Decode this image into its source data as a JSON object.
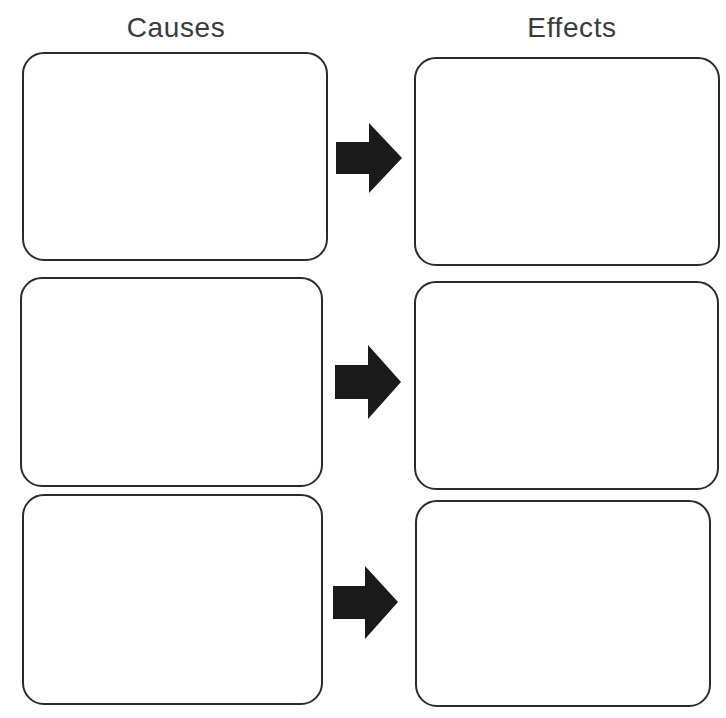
{
  "page": {
    "width": 726,
    "height": 718,
    "background_color": "#ffffff",
    "ink_color": "#2b2b2b",
    "text_color": "#3b3b3b",
    "arrow_color": "#1a1a1a",
    "title_fragment": "Cause and Effect",
    "document_kind": "cause-and-effect graphic organizer worksheet"
  },
  "headings": {
    "causes": "Causes",
    "effects": "Effects"
  },
  "rows": [
    {
      "index": 1,
      "cause_box": {
        "label": "",
        "x": 22,
        "y": 52,
        "w": 306,
        "h": 209
      },
      "arrow": {
        "name": "arrow-right-icon",
        "x": 336,
        "y": 123,
        "w": 66,
        "h": 70
      },
      "effect_box": {
        "label": "",
        "x": 414,
        "y": 57,
        "w": 306,
        "h": 209
      }
    },
    {
      "index": 2,
      "cause_box": {
        "label": "",
        "x": 20,
        "y": 277,
        "w": 303,
        "h": 210
      },
      "arrow": {
        "name": "arrow-right-icon",
        "x": 335,
        "y": 345,
        "w": 66,
        "h": 74
      },
      "effect_box": {
        "label": "",
        "x": 414,
        "y": 281,
        "w": 305,
        "h": 209
      }
    },
    {
      "index": 3,
      "cause_box": {
        "label": "",
        "x": 22,
        "y": 494,
        "w": 301,
        "h": 211
      },
      "arrow": {
        "name": "arrow-right-icon",
        "x": 333,
        "y": 566,
        "w": 65,
        "h": 73
      },
      "effect_box": {
        "label": "",
        "x": 415,
        "y": 500,
        "w": 296,
        "h": 207
      }
    }
  ]
}
